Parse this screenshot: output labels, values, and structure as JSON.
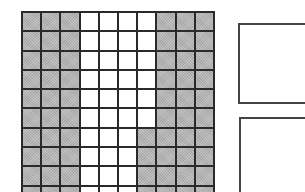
{
  "figure": {
    "grid": {
      "rows": 10,
      "columns": 10,
      "shaded_color": "#b4b4b4",
      "unshaded_color": "#ffffff",
      "line_color": "#2a2a2a",
      "pattern": [
        [
          1,
          1,
          1,
          0,
          0,
          0,
          0,
          1,
          1,
          1
        ],
        [
          1,
          1,
          1,
          0,
          0,
          0,
          0,
          1,
          1,
          1
        ],
        [
          1,
          1,
          1,
          0,
          0,
          0,
          0,
          1,
          1,
          1
        ],
        [
          1,
          1,
          1,
          0,
          0,
          0,
          0,
          1,
          1,
          1
        ],
        [
          1,
          1,
          1,
          0,
          0,
          0,
          0,
          1,
          1,
          1
        ],
        [
          1,
          1,
          1,
          0,
          0,
          0,
          0,
          1,
          1,
          1
        ],
        [
          1,
          1,
          1,
          0,
          0,
          0,
          1,
          1,
          1,
          1
        ],
        [
          1,
          1,
          1,
          0,
          0,
          0,
          1,
          1,
          1,
          1
        ],
        [
          1,
          1,
          1,
          0,
          0,
          0,
          1,
          1,
          1,
          1
        ],
        [
          1,
          1,
          1,
          0,
          0,
          0,
          1,
          1,
          1,
          1
        ]
      ]
    },
    "answer_boxes": [
      {
        "id": "box1",
        "content": ""
      },
      {
        "id": "box2",
        "content": ""
      }
    ]
  }
}
